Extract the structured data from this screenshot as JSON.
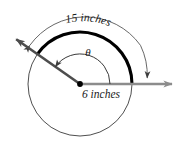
{
  "figure": {
    "type": "geometry-diagram",
    "labels": {
      "arc_length": "15 inches",
      "radius": "6 inches",
      "angle": "θ"
    },
    "colors": {
      "circle_stroke": "#3a3a3a",
      "bold_arc_stroke": "#000000",
      "terminal_ray": "#4d4d4d",
      "initial_ray": "#8c8c8c",
      "measure_arc": "#4d4d4d",
      "vertex_dot": "#000000",
      "background": "#ffffff",
      "text": "#1a1a1a"
    },
    "geometry": {
      "center_x": 80,
      "center_y": 84,
      "circle_radius": 52,
      "measure_arc_radius": 68,
      "theta_arc_radius": 30,
      "initial_ray_angle_deg": 0,
      "terminal_ray_angle_deg": 145,
      "terminal_ray_length": 78,
      "initial_ray_length": 92
    }
  }
}
